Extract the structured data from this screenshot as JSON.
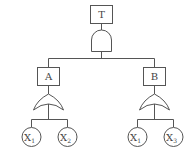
{
  "diagram": {
    "type": "fault-tree",
    "top_event": {
      "label": "T",
      "gate": "AND"
    },
    "intermediate_events": [
      {
        "label": "A",
        "gate": "OR",
        "children": [
          {
            "base": "X",
            "sub": "1"
          },
          {
            "base": "X",
            "sub": "2"
          }
        ]
      },
      {
        "label": "B",
        "gate": "OR",
        "children": [
          {
            "base": "X",
            "sub": "1"
          },
          {
            "base": "X",
            "sub": "3"
          }
        ]
      }
    ]
  }
}
